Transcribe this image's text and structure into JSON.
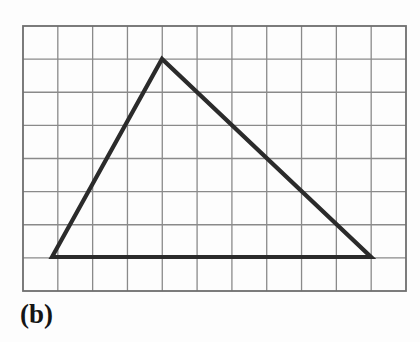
{
  "figure": {
    "caption": "(b)",
    "background_color": "#fdfdfd",
    "grid": {
      "columns": 11,
      "rows": 8,
      "left": 23,
      "top": 26,
      "right": 406,
      "bottom": 291,
      "cell_width": 34.8,
      "cell_height": 33.1,
      "line_color": "#8a8a8a",
      "border_color": "#6e6e6e",
      "line_width": 1.3,
      "border_width": 1.8
    }
  },
  "chart_data": {
    "type": "scatter",
    "title": "(b)",
    "xlabel": "",
    "ylabel": "",
    "grid": true,
    "legend": null,
    "xlim": [
      0,
      11
    ],
    "ylim": [
      0,
      8
    ],
    "xticks": [
      0,
      1,
      2,
      3,
      4,
      5,
      6,
      7,
      8,
      9,
      10,
      11
    ],
    "yticks": [
      0,
      1,
      2,
      3,
      4,
      5,
      6,
      7,
      8
    ],
    "xtick_labels": [],
    "ytick_labels": [],
    "annotations": [
      {
        "name": "triangle",
        "type": "polygon",
        "closed": true,
        "stroke_color": "#2b2b2b",
        "stroke_width": 4.2,
        "fill": "none",
        "vertices_grid": [
          {
            "label": "bottom-left",
            "col": 0.83,
            "row": 7.0
          },
          {
            "label": "apex",
            "col": 4.0,
            "row": 1.0
          },
          {
            "label": "bottom-right",
            "col": 10.0,
            "row": 7.0
          }
        ],
        "vertices_px": [
          {
            "label": "bottom-left",
            "x": 52,
            "y": 257
          },
          {
            "label": "apex",
            "x": 162,
            "y": 59
          },
          {
            "label": "bottom-right",
            "x": 371,
            "y": 257
          }
        ],
        "base_length_cells": 9.17,
        "height_cells": 6
      }
    ]
  }
}
